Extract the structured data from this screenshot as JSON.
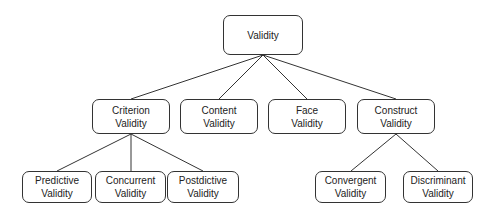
{
  "diagram": {
    "type": "tree",
    "colors": {
      "stroke": "#333333",
      "text": "#222222",
      "background": "#ffffff"
    },
    "nodes": {
      "validity": {
        "line1": "Validity",
        "line2": ""
      },
      "criterion": {
        "line1": "Criterion",
        "line2": "Validity"
      },
      "content": {
        "line1": "Content",
        "line2": "Validity"
      },
      "face": {
        "line1": "Face",
        "line2": "Validity"
      },
      "construct": {
        "line1": "Construct",
        "line2": "Validity"
      },
      "predictive": {
        "line1": "Predictive",
        "line2": "Validity"
      },
      "concurrent": {
        "line1": "Concurrent",
        "line2": "Validity"
      },
      "postdictive": {
        "line1": "Postdictive",
        "line2": "Validity"
      },
      "convergent": {
        "line1": "Convergent",
        "line2": "Validity"
      },
      "discriminant": {
        "line1": "Discriminant",
        "line2": "Validity"
      }
    },
    "edges": [
      [
        "Validity",
        "Criterion Validity"
      ],
      [
        "Validity",
        "Content Validity"
      ],
      [
        "Validity",
        "Face Validity"
      ],
      [
        "Validity",
        "Construct Validity"
      ],
      [
        "Criterion Validity",
        "Predictive Validity"
      ],
      [
        "Criterion Validity",
        "Concurrent Validity"
      ],
      [
        "Criterion Validity",
        "Postdictive Validity"
      ],
      [
        "Construct Validity",
        "Convergent Validity"
      ],
      [
        "Construct Validity",
        "Discriminant Validity"
      ]
    ]
  }
}
